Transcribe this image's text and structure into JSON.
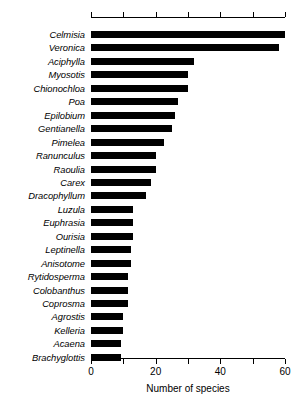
{
  "chart_data": {
    "type": "bar",
    "orientation": "horizontal",
    "title": "",
    "subtitle": "",
    "xlabel": "Number of species",
    "ylabel": "",
    "xlim": [
      0,
      60
    ],
    "ylim": null,
    "grid": false,
    "legend": null,
    "legend_position": "none",
    "bar_color": "#000000",
    "axis_color": "#000000",
    "x_ticks": [
      0,
      10,
      20,
      30,
      40,
      50,
      60
    ],
    "x_tick_labels": [
      "0",
      "",
      "20",
      "",
      "40",
      "",
      "60"
    ],
    "top_axis": true,
    "categories": [
      "Celmisia",
      "Veronica",
      "Aciphylla",
      "Myosotis",
      "Chionochloa",
      "Poa",
      "Epilobium",
      "Gentianella",
      "Pimelea",
      "Ranunculus",
      "Raoulia",
      "Carex",
      "Dracophyllum",
      "Luzula",
      "Euphrasia",
      "Ourisia",
      "Leptinella",
      "Anisotome",
      "Rytidosperma",
      "Colobanthus",
      "Coprosma",
      "Agrostis",
      "Kelleria",
      "Acaena",
      "Brachyglottis"
    ],
    "values": [
      60,
      58,
      32,
      30,
      30,
      27,
      26,
      25,
      22.5,
      20,
      20,
      18.5,
      17,
      13,
      13,
      13,
      12.3,
      12.3,
      11.5,
      11.5,
      11.5,
      10,
      10,
      9.3,
      9.3
    ]
  }
}
